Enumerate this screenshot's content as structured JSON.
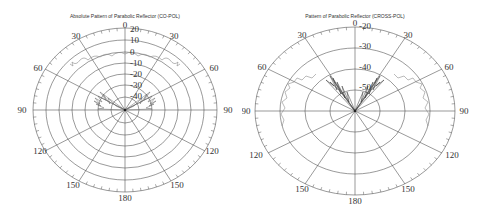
{
  "chart_data": [
    {
      "type": "polar",
      "title": "Absolute Pattern of Parabolic Reflector (CO-POL)",
      "angle_labels": [
        "0",
        "30",
        "60",
        "90",
        "120",
        "150",
        "180",
        "150",
        "120",
        "90",
        "60",
        "30"
      ],
      "angle_ticks_deg": [
        0,
        30,
        60,
        90,
        120,
        150,
        180,
        210,
        240,
        270,
        300,
        330
      ],
      "radial_labels": [
        "20",
        "10",
        "0",
        "-10",
        "-20",
        "-30",
        "-40"
      ],
      "radial_range_db": [
        -50,
        20
      ],
      "grid": true,
      "series": [
        {
          "name": "co-pol pattern",
          "description": "Main lobe near 0 dB across roughly ±60°, decaying with dense sidelobes between -30 and -50 dB near ±60–90°",
          "angles_deg": [
            -70,
            -60,
            -50,
            -40,
            -30,
            -20,
            -10,
            0,
            10,
            20,
            30,
            40,
            50,
            60,
            70
          ],
          "values_db": [
            -8,
            -5,
            -2,
            0,
            1,
            2,
            1,
            2,
            1,
            2,
            1,
            0,
            -2,
            -5,
            -8
          ]
        }
      ]
    },
    {
      "type": "polar",
      "title": "Pattern of Parabolic Reflector (CROSS-POL)",
      "angle_labels": [
        "0",
        "30",
        "60",
        "90",
        "120",
        "150",
        "180",
        "150",
        "120",
        "90",
        "60",
        "30"
      ],
      "angle_ticks_deg": [
        0,
        30,
        60,
        90,
        120,
        150,
        180,
        210,
        240,
        270,
        300,
        330
      ],
      "radial_labels": [
        "-20",
        "-30",
        "-40",
        "-50"
      ],
      "radial_range_db": [
        -60,
        -20
      ],
      "grid": true,
      "series": [
        {
          "name": "cross-pol pattern",
          "description": "Dense lobes between -40 and -55 dB around ±20–45°, lower ragged trace near -45 dB out to ±90°",
          "angles_deg": [
            -90,
            -75,
            -60,
            -45,
            -35,
            -25,
            -15,
            -5,
            0,
            5,
            15,
            25,
            35,
            45,
            60,
            75,
            90
          ],
          "values_db": [
            -46,
            -44,
            -43,
            -40,
            -42,
            -44,
            -48,
            -55,
            -60,
            -55,
            -48,
            -44,
            -42,
            -40,
            -43,
            -44,
            -46
          ]
        }
      ]
    }
  ],
  "plots": {
    "left": {
      "title": "Absolute Pattern of Parabolic Reflector (CO-POL)",
      "angle_top": "0",
      "angle_30_left": "30",
      "angle_30_right": "30",
      "angle_60_left": "60",
      "angle_60_right": "60",
      "angle_90_left": "90",
      "angle_90_right": "90",
      "angle_120_left": "120",
      "angle_120_right": "120",
      "angle_150_left": "150",
      "angle_150_right": "150",
      "angle_bottom": "180",
      "radial": [
        "20",
        "10",
        "0",
        "-10",
        "-20",
        "-30",
        "-40"
      ]
    },
    "right": {
      "title": "Pattern of Parabolic Reflector (CROSS-POL)",
      "angle_top": "0",
      "angle_30_left": "30",
      "angle_30_right": "30",
      "angle_60_left": "60",
      "angle_60_right": "60",
      "angle_90_left": "90",
      "angle_90_right": "90",
      "angle_120_left": "120",
      "angle_120_right": "120",
      "angle_150_left": "150",
      "angle_150_right": "150",
      "angle_bottom": "180",
      "radial": [
        "-20",
        "-30",
        "-40",
        "-50"
      ]
    }
  },
  "colors": {
    "grid": "#555555",
    "trace_co": "#888888",
    "trace_cross": "#333333",
    "text": "#333333"
  }
}
